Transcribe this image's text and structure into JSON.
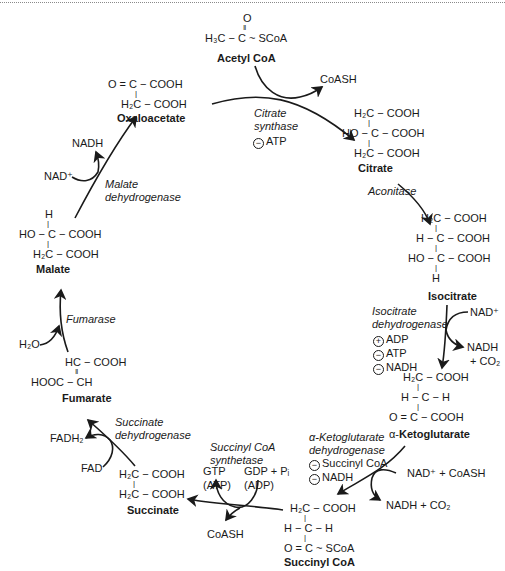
{
  "figure": {
    "colors": {
      "ink": "#1a1a1a",
      "background": "#ffffff",
      "border": "#8a8a8a"
    }
  },
  "molecules": {
    "acetyl_coa": {
      "name": "Acetyl CoA",
      "rows": [
        "O",
        "‖",
        "H₃C − C ~ SCoA"
      ]
    },
    "citrate": {
      "name": "Citrate",
      "rows": [
        "H₂C − COOH",
        "|",
        "HO − C − COOH",
        "|",
        "H₂C − COOH"
      ]
    },
    "isocitrate": {
      "name": "Isocitrate",
      "rows": [
        "H₂C − COOH",
        "|",
        "H − C − COOH",
        "|",
        "HO − C − COOH",
        "|",
        "H"
      ]
    },
    "alpha_ketoglutarate": {
      "name_prefix": "α-",
      "name": "Ketoglutarate",
      "rows": [
        "H₂C − COOH",
        "|",
        "H − C − H",
        "|",
        "O = C − COOH"
      ]
    },
    "succinyl_coa": {
      "name": "Succinyl CoA",
      "rows": [
        "H₂C − COOH",
        "|",
        "H − C − H",
        "|",
        "O = C ~ SCoA"
      ]
    },
    "succinate": {
      "name": "Succinate",
      "rows": [
        "H₂C − COOH",
        "|",
        "H₂C − COOH"
      ]
    },
    "fumarate": {
      "name": "Fumarate",
      "rows": [
        "HC − COOH",
        "‖",
        "HOOC − CH"
      ]
    },
    "malate": {
      "name": "Malate",
      "rows": [
        "H",
        "|",
        "HO − C − COOH",
        "|",
        "H₂C − COOH"
      ]
    },
    "oxaloacetate": {
      "name": "Oxaloacetate",
      "rows": [
        "O = C − COOH",
        "|",
        "H₂C − COOH"
      ]
    }
  },
  "enzymes": {
    "citrate_synthase": {
      "lines": [
        "Citrate",
        "synthase"
      ],
      "regulators": [
        {
          "sign": "−",
          "label": "ATP"
        }
      ]
    },
    "aconitase": {
      "lines": [
        "Aconitase"
      ]
    },
    "isocitrate_dh": {
      "lines": [
        "Isocitrate",
        "dehydrogenase"
      ],
      "regulators": [
        {
          "sign": "+",
          "label": "ADP"
        },
        {
          "sign": "−",
          "label": "ATP"
        },
        {
          "sign": "−",
          "label": "NADH"
        }
      ]
    },
    "akg_dh": {
      "lines": [
        "α-Ketoglutarate",
        "dehydrogenase"
      ],
      "regulators": [
        {
          "sign": "−",
          "label": "Succinyl CoA"
        },
        {
          "sign": "−",
          "label": "NADH"
        }
      ]
    },
    "succinyl_coa_synthetase": {
      "lines": [
        "Succinyl CoA",
        "synthetase"
      ]
    },
    "succinate_dh": {
      "lines": [
        "Succinate",
        "dehydrogenase"
      ]
    },
    "fumarase": {
      "lines": [
        "Fumarase"
      ]
    },
    "malate_dh": {
      "lines": [
        "Malate",
        "dehydrogenase"
      ]
    }
  },
  "cofactors": {
    "coash_top": "CoASH",
    "nad_iso": "NAD⁺",
    "nadh_iso": "NADH",
    "co2_iso": "+ CO₂",
    "nad_coash_akg": "NAD⁺ + CoASH",
    "nadh_co2_akg": "NADH + CO₂",
    "gtp": "GTP",
    "atp_paren": "(ATP)",
    "gdp_pi": "GDP + Pᵢ",
    "adp_paren": "(ADP)",
    "coash_bottom": "CoASH",
    "fadh2": "FADH₂",
    "fad": "FAD",
    "h2o": "H₂O",
    "nad_malate": "NAD⁺",
    "nadh_malate": "NADH"
  }
}
